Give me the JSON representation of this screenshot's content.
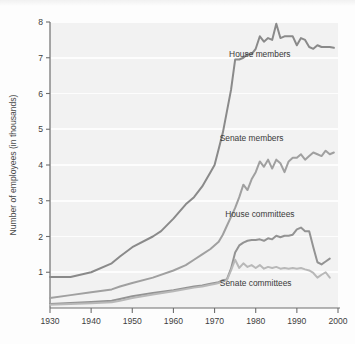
{
  "chart_data": {
    "type": "line",
    "title": "",
    "xlabel": "",
    "ylabel": "Number of employees (in thousands)",
    "xlim": [
      1930,
      2000
    ],
    "ylim": [
      0,
      8
    ],
    "xticks": [
      1930,
      1940,
      1950,
      1960,
      1970,
      1980,
      1990,
      2000
    ],
    "xticklabels": [
      "1930",
      "1940",
      "1950",
      "1960",
      "1970",
      "1980",
      "1990",
      "2000"
    ],
    "yticks": [
      1,
      2,
      3,
      4,
      5,
      6,
      7,
      8
    ],
    "yticklabels": [
      "1",
      "2",
      "3",
      "4",
      "5",
      "6",
      "7",
      "8"
    ],
    "grid": "horizontal-white",
    "legend_position": "inline-annotations",
    "plot_bgcolor": "#f2f2f2",
    "series": [
      {
        "name": "House members",
        "color": "#8a8a8a",
        "label_x": 1981,
        "label_y": 7.02,
        "x": [
          1930,
          1935,
          1940,
          1945,
          1947,
          1950,
          1955,
          1957,
          1960,
          1963,
          1965,
          1967,
          1969,
          1970,
          1971,
          1972,
          1973,
          1974,
          1975,
          1976,
          1977,
          1978,
          1979,
          1980,
          1981,
          1982,
          1983,
          1984,
          1985,
          1986,
          1987,
          1988,
          1989,
          1990,
          1991,
          1992,
          1993,
          1994,
          1995,
          1996,
          1997,
          1998,
          1999
        ],
        "y": [
          0.87,
          0.87,
          1.0,
          1.25,
          1.44,
          1.7,
          2.0,
          2.15,
          2.5,
          2.9,
          3.1,
          3.4,
          3.8,
          4.0,
          4.45,
          4.9,
          5.5,
          6.1,
          6.95,
          6.95,
          7.0,
          7.1,
          7.1,
          7.25,
          7.6,
          7.45,
          7.55,
          7.5,
          7.95,
          7.55,
          7.6,
          7.6,
          7.6,
          7.35,
          7.55,
          7.5,
          7.3,
          7.25,
          7.35,
          7.3,
          7.3,
          7.3,
          7.28
        ]
      },
      {
        "name": "Senate members",
        "color": "#a0a0a0",
        "label_x": 1979,
        "label_y": 4.68,
        "x": [
          1930,
          1935,
          1940,
          1945,
          1947,
          1950,
          1955,
          1960,
          1963,
          1965,
          1967,
          1969,
          1971,
          1972,
          1973,
          1974,
          1975,
          1976,
          1977,
          1978,
          1979,
          1980,
          1981,
          1982,
          1983,
          1984,
          1985,
          1986,
          1987,
          1988,
          1989,
          1990,
          1991,
          1992,
          1993,
          1994,
          1995,
          1996,
          1997,
          1998,
          1999
        ],
        "y": [
          0.28,
          0.36,
          0.44,
          0.52,
          0.6,
          0.7,
          0.85,
          1.05,
          1.2,
          1.35,
          1.5,
          1.65,
          1.85,
          2.05,
          2.3,
          2.55,
          2.8,
          3.1,
          3.45,
          3.3,
          3.6,
          3.8,
          4.1,
          3.95,
          4.15,
          3.9,
          4.15,
          4.05,
          3.8,
          4.1,
          4.2,
          4.2,
          4.3,
          4.15,
          4.25,
          4.35,
          4.3,
          4.25,
          4.4,
          4.3,
          4.35
        ]
      },
      {
        "name": "House committees",
        "color": "#939393",
        "label_x": 1981,
        "label_y": 2.55,
        "x": [
          1930,
          1935,
          1940,
          1945,
          1947,
          1950,
          1955,
          1960,
          1965,
          1967,
          1969,
          1970,
          1971,
          1972,
          1973,
          1974,
          1975,
          1976,
          1977,
          1978,
          1979,
          1980,
          1981,
          1982,
          1983,
          1984,
          1985,
          1986,
          1987,
          1988,
          1989,
          1990,
          1991,
          1992,
          1993,
          1994,
          1995,
          1996,
          1997,
          1998
        ],
        "y": [
          0.11,
          0.14,
          0.17,
          0.2,
          0.25,
          0.33,
          0.42,
          0.5,
          0.6,
          0.63,
          0.68,
          0.7,
          0.72,
          0.78,
          0.8,
          1.1,
          1.55,
          1.75,
          1.83,
          1.88,
          1.9,
          1.9,
          1.92,
          1.88,
          1.95,
          1.92,
          2.02,
          1.98,
          2.02,
          2.02,
          2.05,
          2.2,
          2.25,
          2.15,
          2.15,
          1.7,
          1.28,
          1.22,
          1.3,
          1.38
        ]
      },
      {
        "name": "Senate committees",
        "color": "#b8b8b8",
        "label_x": 1980,
        "label_y": 0.62,
        "x": [
          1930,
          1935,
          1940,
          1945,
          1947,
          1950,
          1955,
          1960,
          1965,
          1967,
          1969,
          1970,
          1971,
          1972,
          1973,
          1974,
          1975,
          1976,
          1977,
          1978,
          1979,
          1980,
          1981,
          1982,
          1983,
          1984,
          1985,
          1986,
          1987,
          1988,
          1989,
          1990,
          1991,
          1992,
          1993,
          1994,
          1995,
          1996,
          1997,
          1998
        ],
        "y": [
          0.09,
          0.11,
          0.13,
          0.16,
          0.2,
          0.28,
          0.38,
          0.47,
          0.57,
          0.6,
          0.65,
          0.67,
          0.7,
          0.75,
          0.78,
          1.05,
          1.35,
          1.12,
          1.25,
          1.15,
          1.2,
          1.12,
          1.2,
          1.1,
          1.15,
          1.12,
          1.15,
          1.1,
          1.12,
          1.1,
          1.12,
          1.1,
          1.12,
          1.08,
          1.05,
          0.98,
          0.85,
          0.93,
          1.0,
          0.85
        ]
      }
    ]
  }
}
